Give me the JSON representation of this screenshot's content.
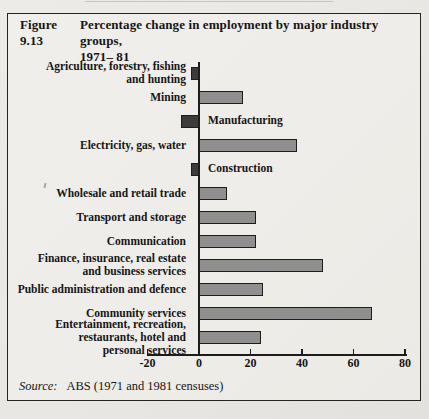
{
  "figure": {
    "title_label": "Figure 9.13",
    "title_line1": "Percentage change in employment by major industry groups,",
    "title_line2": "1971– 81",
    "source_label": "Source:",
    "source_text": "ABS (1971 and 1981 censuses)"
  },
  "chart_data": {
    "type": "bar",
    "orientation": "horizontal",
    "xlabel": "",
    "ylabel": "",
    "categories": [
      "Agriculture, forestry, fishing and hunting",
      "Mining",
      "Manufacturing",
      "Electricity, gas, water",
      "Construction",
      "Wholesale and retail trade",
      "Transport and storage",
      "Communication",
      "Finance, insurance, real estate and business services",
      "Public administration and defence",
      "Community services",
      "Entertainment, recreation, restaurants, hotel and personal services"
    ],
    "values": [
      -3,
      17,
      -7,
      38,
      -3,
      11,
      22,
      22,
      48,
      25,
      67,
      24
    ],
    "label_lines": [
      [
        "Agriculture, forestry, fishing",
        "and hunting"
      ],
      [
        "Mining"
      ],
      [
        "Manufacturing"
      ],
      [
        "Electricity, gas, water"
      ],
      [
        "Construction"
      ],
      [
        "Wholesale and retail trade"
      ],
      [
        "Transport and storage"
      ],
      [
        "Communication"
      ],
      [
        "Finance, insurance, real estate",
        "and business services"
      ],
      [
        "Public administration and defence"
      ],
      [
        "Community services"
      ],
      [
        "Entertainment, recreation,",
        "restaurants, hotel and",
        "personal services"
      ]
    ],
    "label_side": [
      "left",
      "left",
      "right",
      "left",
      "right",
      "left",
      "left",
      "left",
      "left",
      "left",
      "left",
      "left"
    ],
    "axis": {
      "min": -20,
      "max": 80,
      "tick_values": [
        -20,
        0,
        20,
        40,
        60,
        80
      ],
      "tick_labels": [
        "-20",
        "0",
        "20",
        "40",
        "60",
        "80"
      ],
      "grid": false
    },
    "legend": null,
    "colors": {
      "positive_fill": "#8f8f8f",
      "negative_fill": "#3b3b3b",
      "bar_border": "#1d1d1d",
      "axis": "#1c1c1c"
    }
  }
}
